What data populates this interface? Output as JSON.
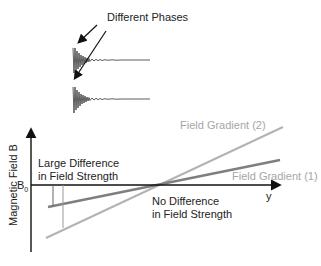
{
  "title": "Different Phases",
  "axis": {
    "y_label": "Magnetic Field B",
    "x_label": "y",
    "b0_label": "B",
    "b0_sub": "0"
  },
  "annotations": {
    "large_diff_line1": "Large Difference",
    "large_diff_line2": "in Field Strength",
    "no_diff_line1": "No Difference",
    "no_diff_line2": "in Field Strength"
  },
  "gradients": [
    {
      "label": "Field Gradient (1)",
      "color": "#7f7f7f"
    },
    {
      "label": "Field Gradient (2)",
      "color": "#b3b3b3"
    }
  ]
}
